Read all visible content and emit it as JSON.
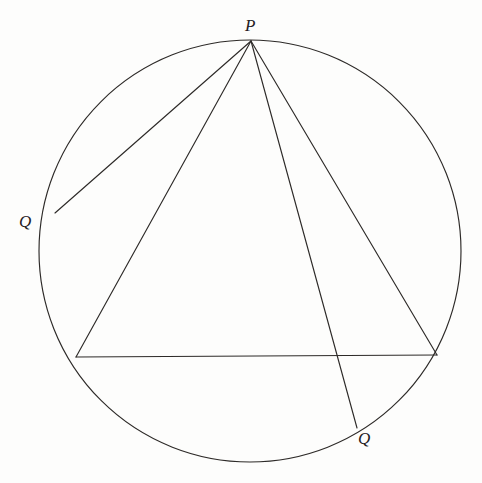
{
  "figure": {
    "background_color": "#fdfdfc",
    "stroke_color": "#2d2a28",
    "stroke_width": 1.15,
    "canvas": {
      "width": 482,
      "height": 483
    },
    "circle": {
      "name": "main-circle",
      "cx": 250,
      "cy": 251,
      "r": 211
    },
    "points": {
      "P": {
        "label": "P",
        "x": 251,
        "y": 41,
        "label_x": 245,
        "label_y": 17
      },
      "Q1": {
        "label": "Q",
        "x": 55,
        "y": 213,
        "label_x": 19,
        "label_y": 213
      },
      "Q2": {
        "label": "Q",
        "x": 357,
        "y": 428,
        "label_x": 358,
        "label_y": 430
      },
      "A": {
        "label": "",
        "x": 76,
        "y": 357
      },
      "B": {
        "label": "",
        "x": 437,
        "y": 355
      }
    },
    "segments": [
      {
        "name": "segment-p-q-left",
        "x1": 251,
        "y1": 41,
        "x2": 55,
        "y2": 213
      },
      {
        "name": "segment-p-a",
        "x1": 251,
        "y1": 41,
        "x2": 76,
        "y2": 357
      },
      {
        "name": "segment-p-q-bottom",
        "x1": 251,
        "y1": 41,
        "x2": 357,
        "y2": 428
      },
      {
        "name": "segment-p-b",
        "x1": 251,
        "y1": 41,
        "x2": 437,
        "y2": 355
      },
      {
        "name": "segment-chord-ab",
        "x1": 76,
        "y1": 357,
        "x2": 437,
        "y2": 355
      }
    ],
    "labels": [
      {
        "name": "label-point-p",
        "text": "P"
      },
      {
        "name": "label-point-q-left",
        "text": "Q"
      },
      {
        "name": "label-point-q-bottom",
        "text": "Q"
      }
    ]
  }
}
